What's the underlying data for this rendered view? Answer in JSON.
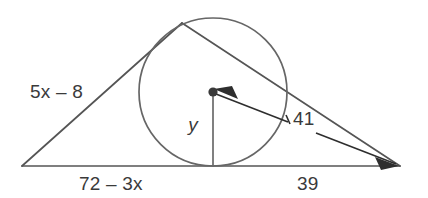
{
  "figure": {
    "kind": "geometry-diagram",
    "background_color": "#ffffff",
    "line_color": "#555555",
    "circle_color": "#666666",
    "arrow_color": "#2e2e2e",
    "text_color": "#3a3a3a"
  },
  "labels": {
    "left_side": "5x – 8",
    "bottom_left": "72 – 3x",
    "bottom_right": "39",
    "arrow_length": "41",
    "radius": "y"
  },
  "geometry": {
    "left_vertex": {
      "x": 22,
      "y": 166
    },
    "right_vertex": {
      "x": 400,
      "y": 166
    },
    "circle": {
      "cx": 213,
      "cy": 92,
      "r": 74
    },
    "center_dot": {
      "x": 213,
      "y": 92,
      "r": 4.6
    },
    "base_tangent_point": {
      "x": 213,
      "y": 166
    },
    "left_tangent_point": {
      "x": 148,
      "y": 60
    },
    "radius_line": {
      "x1": 213,
      "y1": 92,
      "x2": 213,
      "y2": 166
    },
    "arrow_line": {
      "x1": 213,
      "y1": 92,
      "x2": 400,
      "y2": 166
    }
  },
  "label_positions": {
    "left_side": {
      "x": 30,
      "y": 98
    },
    "bottom_left": {
      "x": 79,
      "y": 190
    },
    "bottom_right": {
      "x": 297,
      "y": 190
    },
    "arrow_length": {
      "x": 293,
      "y": 125
    },
    "radius": {
      "x": 193,
      "y": 131
    }
  }
}
